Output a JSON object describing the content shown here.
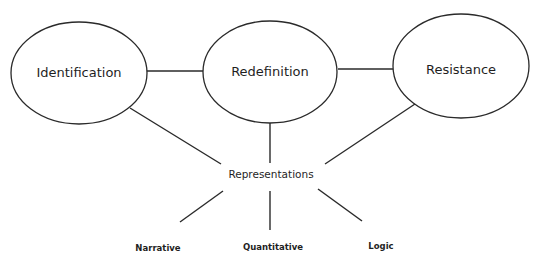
{
  "diagram": {
    "nodes": [
      {
        "id": "identification",
        "label": "Identification"
      },
      {
        "id": "redefinition",
        "label": "Redefinition"
      },
      {
        "id": "resistance",
        "label": "Resistance"
      }
    ],
    "hub": {
      "id": "representations",
      "label": "Representations"
    },
    "leaves": [
      {
        "id": "narrative",
        "label": "Narrative"
      },
      {
        "id": "quantitative",
        "label": "Quantitative"
      },
      {
        "id": "logic",
        "label": "Logic"
      }
    ],
    "edges": [
      [
        "identification",
        "redefinition"
      ],
      [
        "redefinition",
        "resistance"
      ],
      [
        "identification",
        "representations"
      ],
      [
        "redefinition",
        "representations"
      ],
      [
        "resistance",
        "representations"
      ],
      [
        "representations",
        "narrative"
      ],
      [
        "representations",
        "quantitative"
      ],
      [
        "representations",
        "logic"
      ]
    ],
    "colors": {
      "stroke": "#2a2a2a",
      "text": "#1f1f1f",
      "background": "#ffffff"
    }
  }
}
